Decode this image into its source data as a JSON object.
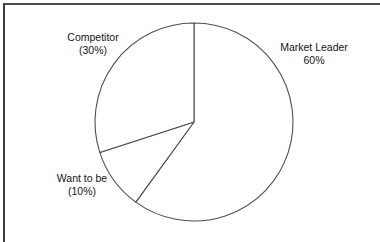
{
  "figure": {
    "caption": "",
    "caption_visible": false
  },
  "chart_data": {
    "type": "pie",
    "title": "",
    "xlabel": "",
    "ylabel": "",
    "legend_position": "none",
    "grid": false,
    "start_angle_deg": 0,
    "direction": "clockwise",
    "categories": [
      "Market Leader",
      "Want to be",
      "Competitor"
    ],
    "values": [
      60,
      10,
      30
    ],
    "units": "percent",
    "slices": [
      {
        "name": "Market Leader",
        "value": 60,
        "label_line1": "Market Leader",
        "label_line2": "60%",
        "start_deg": 0,
        "end_deg": 216,
        "fill": "#ffffff",
        "stroke": "#4f4f4f"
      },
      {
        "name": "Want to be",
        "value": 10,
        "label_line1": "Want to be",
        "label_line2": "(10%)",
        "start_deg": 216,
        "end_deg": 252,
        "fill": "#ffffff",
        "stroke": "#4f4f4f"
      },
      {
        "name": "Competitor",
        "value": 30,
        "label_line1": "Competitor",
        "label_line2": "(30%)",
        "start_deg": 252,
        "end_deg": 360,
        "fill": "#ffffff",
        "stroke": "#4f4f4f"
      }
    ]
  },
  "colors": {
    "slice_fill": "#ffffff",
    "slice_stroke": "#4f4f4f",
    "frame_rule": "#4a4a4a",
    "text": "#141414",
    "page_background": "#ffffff"
  }
}
